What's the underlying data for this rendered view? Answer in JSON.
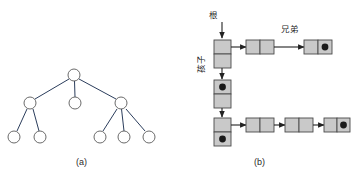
{
  "figure": {
    "caption_a": "(a)",
    "caption_b": "(b)"
  },
  "panel_a": {
    "name": "general-tree",
    "caption": "(a)",
    "node_radius": 6.0,
    "node_fill": "#ffffff",
    "node_stroke": "#5a5a5a",
    "edge_color": "#2b3d5c",
    "nodes": [
      {
        "id": "root",
        "label": "",
        "cx": 74,
        "cy": 75,
        "level": 0
      },
      {
        "id": "c1",
        "label": "",
        "cx": 30,
        "cy": 103,
        "level": 1
      },
      {
        "id": "c2",
        "label": "",
        "cx": 75,
        "cy": 103,
        "level": 1
      },
      {
        "id": "c3",
        "label": "",
        "cx": 121,
        "cy": 103,
        "level": 1
      },
      {
        "id": "g1",
        "label": "",
        "cx": 14,
        "cy": 137,
        "level": 2
      },
      {
        "id": "g2",
        "label": "",
        "cx": 40,
        "cy": 137,
        "level": 2
      },
      {
        "id": "g3",
        "label": "",
        "cx": 100,
        "cy": 137,
        "level": 2
      },
      {
        "id": "g4",
        "label": "",
        "cx": 124,
        "cy": 137,
        "level": 2
      },
      {
        "id": "g5",
        "label": "",
        "cx": 149,
        "cy": 137,
        "level": 2
      }
    ],
    "edges": [
      {
        "from": "root",
        "to": "c1"
      },
      {
        "from": "root",
        "to": "c2"
      },
      {
        "from": "root",
        "to": "c3"
      },
      {
        "from": "c1",
        "to": "g1"
      },
      {
        "from": "c1",
        "to": "g2"
      },
      {
        "from": "c3",
        "to": "g3"
      },
      {
        "from": "c3",
        "to": "g4"
      },
      {
        "from": "c3",
        "to": "g5"
      }
    ]
  },
  "panel_b": {
    "name": "child-sibling-linked-list",
    "caption": "(b)",
    "cell_fill": "#c9c9c9",
    "cell_stroke": "#4a4a4a",
    "arrow_color": "#222222",
    "null_marker": "filled-dot",
    "labels": {
      "root": "根",
      "sibling": "兄弟",
      "child": "孩子"
    },
    "rows": [
      {
        "id": "row-1",
        "head": {
          "id": "n-root",
          "orientation": "vertical",
          "child_null": false,
          "sibling_null": false
        },
        "siblings": [
          {
            "id": "n-r1-s1",
            "orientation": "horizontal",
            "null_marker": false
          },
          {
            "id": "n-r1-s2",
            "orientation": "horizontal",
            "null_marker": true
          }
        ]
      },
      {
        "id": "row-2",
        "head": {
          "id": "n-mid",
          "orientation": "vertical",
          "child_null": true,
          "sibling_null": false
        },
        "siblings": []
      },
      {
        "id": "row-3",
        "head": {
          "id": "n-bot",
          "orientation": "vertical",
          "child_null": false,
          "sibling_null": true
        },
        "siblings": [
          {
            "id": "n-r3-s1",
            "orientation": "horizontal",
            "null_marker": false
          },
          {
            "id": "n-r3-s2",
            "orientation": "horizontal",
            "null_marker": false
          },
          {
            "id": "n-r3-s3",
            "orientation": "horizontal",
            "null_marker": true
          }
        ]
      }
    ]
  }
}
